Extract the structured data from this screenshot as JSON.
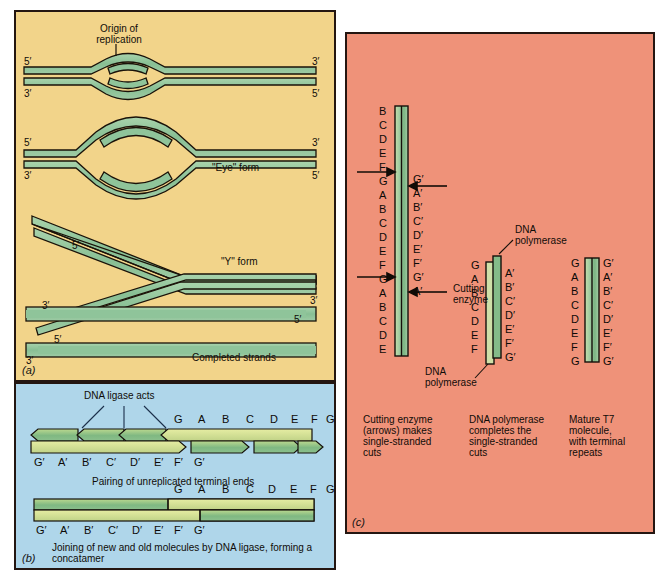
{
  "figure": {
    "background": "#ffffff",
    "panels": [
      {
        "id": "a",
        "label": "(a)",
        "bg": "#f2d48a"
      },
      {
        "id": "b",
        "label": "(b)",
        "bg": "#afd6ea"
      },
      {
        "id": "c",
        "label": "(c)",
        "bg": "#ef9279"
      }
    ],
    "colors": {
      "panel_a_bg": "#f2d48a",
      "panel_b_bg": "#afd6ea",
      "panel_c_bg": "#ef9279",
      "dna_strand_fill": "#8fc49a",
      "dna_strand_light": "#dfe79a",
      "outline": "#241611"
    }
  },
  "panel_a": {
    "label": "(a)",
    "origin_label": "Origin of\nreplication",
    "eye_form_label": "\"Eye\" form",
    "y_form_label": "\"Y\" form",
    "completed_label": "Completed strands",
    "row1": {
      "left_top": "5′",
      "left_bottom": "3′",
      "right_top": "3′",
      "right_bottom": "5′"
    },
    "row2": {
      "left_top": "5′",
      "left_bottom": "3′",
      "right_top": "3′",
      "right_bottom": "5′"
    },
    "row3": {
      "upper_fork": "5′",
      "lower_fork": "3′"
    },
    "row4": {
      "top_right": "3′",
      "top_inner": "5′",
      "bottom_inner": "5′",
      "bottom_left": "3′"
    }
  },
  "panel_b": {
    "label": "(b)",
    "ligase_label": "DNA ligase acts",
    "caption1": "Pairing of unreplicated terminal ends",
    "caption2": "Joining of new and old molecules by DNA ligase, forming a\nconcatamer",
    "row1_top_letters": [
      "G",
      "A",
      "B",
      "C",
      "D",
      "E",
      "F",
      "G"
    ],
    "row1_bottom_letters": [
      "G′",
      "A′",
      "B′",
      "C′",
      "D′",
      "E′",
      "F′",
      "G′"
    ],
    "row2_top_letters": [
      "G",
      "A",
      "B",
      "C",
      "D",
      "E",
      "F",
      "G"
    ],
    "row2_bottom_letters": [
      "G′",
      "A′",
      "B′",
      "C′",
      "D′",
      "E′",
      "F′",
      "G′"
    ]
  },
  "panel_c": {
    "label": "(c)",
    "cutting_enzyme_label": "Cutting\nenzyme",
    "dna_polymerase_label_top": "DNA\npolymerase",
    "dna_polymerase_label_bottom": "DNA\npolymerase",
    "caption_left": "Cutting enzyme\n(arrows) makes\nsingle-stranded\ncuts",
    "caption_mid": "DNA polymerase\ncompletes the\nsingle-stranded\ncuts",
    "caption_right": "Mature T7\nmolecule,\nwith terminal\nrepeats",
    "col1": {
      "left_letters": [
        "B",
        "C",
        "D",
        "E",
        "F",
        "G",
        "A",
        "B",
        "C",
        "D",
        "E",
        "F",
        "G",
        "A",
        "B",
        "C",
        "D",
        "E"
      ],
      "right_letters": [
        "G′",
        "A′",
        "B′",
        "C′",
        "D′",
        "E′",
        "F′",
        "G′",
        "A′"
      ],
      "arrow_count": 4
    },
    "col2": {
      "left_letters": [
        "G",
        "A",
        "B",
        "C",
        "D",
        "E",
        "F"
      ],
      "right_letters": [
        "A′",
        "B′",
        "C′",
        "D′",
        "E′",
        "F′",
        "G′"
      ]
    },
    "col3": {
      "left_letters": [
        "G",
        "A",
        "B",
        "C",
        "D",
        "E",
        "F",
        "G"
      ],
      "right_letters": [
        "G′",
        "A′",
        "B′",
        "C′",
        "D′",
        "E′",
        "F′",
        "G′"
      ]
    }
  }
}
